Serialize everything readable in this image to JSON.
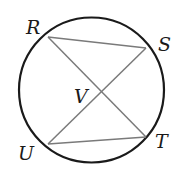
{
  "diagram": {
    "type": "circle-with-chords",
    "circle": {
      "cx": 91.5,
      "cy": 90,
      "r": 72.5,
      "stroke": "#1a1a1a",
      "stroke_width": 2.2
    },
    "points": [
      {
        "id": "R",
        "label": "R",
        "x": 48,
        "y": 37,
        "label_x": 26,
        "label_y": 34
      },
      {
        "id": "S",
        "label": "S",
        "x": 146,
        "y": 48,
        "label_x": 158,
        "label_y": 51
      },
      {
        "id": "T",
        "label": "T",
        "x": 146,
        "y": 137,
        "label_x": 155,
        "label_y": 148
      },
      {
        "id": "U",
        "label": "U",
        "x": 48,
        "y": 144,
        "label_x": 18,
        "label_y": 160
      },
      {
        "id": "V",
        "label": "V",
        "x": 100,
        "y": 92,
        "label_x": 74,
        "label_y": 103
      }
    ],
    "segments": [
      {
        "name": "chord-RS",
        "from": "R",
        "to": "S"
      },
      {
        "name": "chord-RT",
        "from": "R",
        "to": "T"
      },
      {
        "name": "chord-US",
        "from": "U",
        "to": "S"
      },
      {
        "name": "chord-UT",
        "from": "U",
        "to": "T"
      }
    ],
    "segment_color": "#7a7a7a",
    "segment_width": 1.5
  }
}
